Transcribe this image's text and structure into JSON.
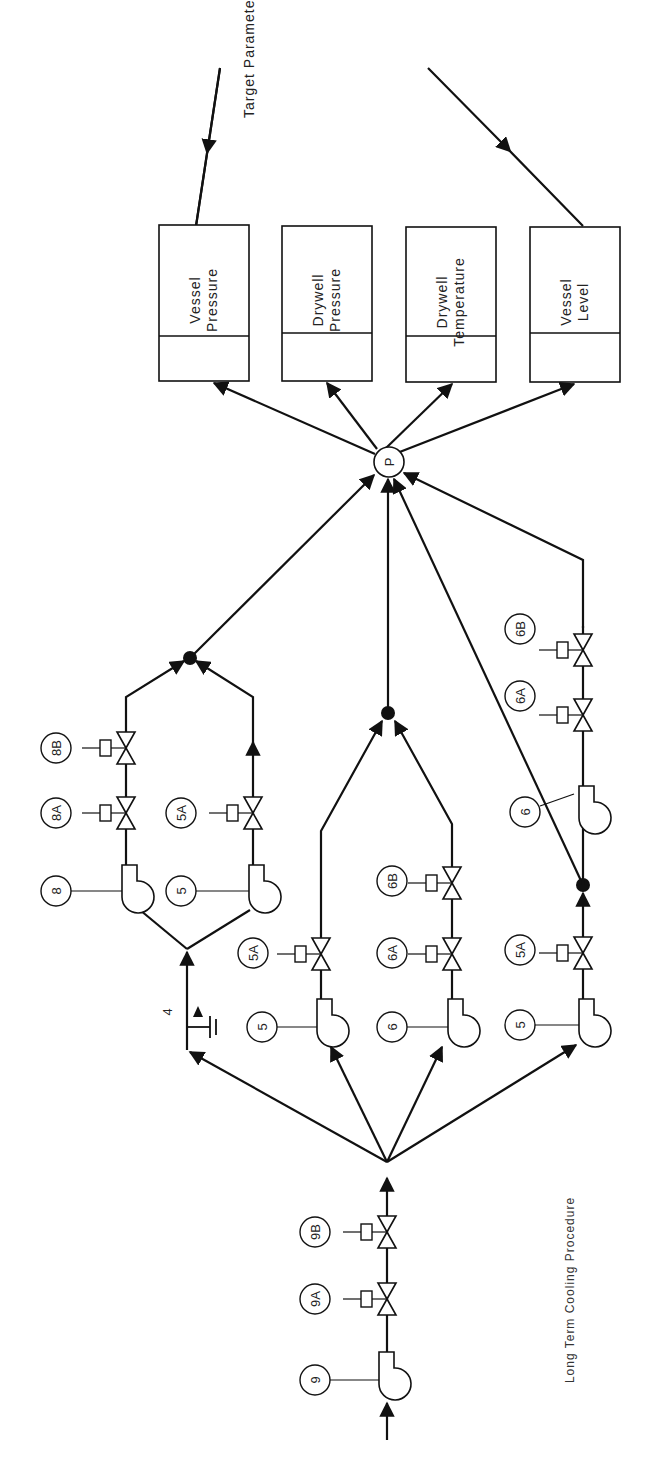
{
  "title": "Long Term Cooling Procedure",
  "target_label": "Target Parameter",
  "hub_label": "P",
  "check_valve_label": "4",
  "parameters": [
    {
      "line1": "Vessel",
      "line2": "Pressure"
    },
    {
      "line1": "Drywell",
      "line2": "Pressure"
    },
    {
      "line1": "Drywell",
      "line2": "Temperature"
    },
    {
      "line1": "Vessel",
      "line2": "Level"
    }
  ],
  "components": {
    "supply_pump": "9",
    "supply_valve_a": "9A",
    "supply_valve_b": "9B",
    "top_branch": {
      "pump_1": "8",
      "valve_1a": "8A",
      "valve_1b": "8B",
      "pump_2": "5",
      "valve_2a": "5A"
    },
    "middle_branch": {
      "pump_1": "5",
      "valve_1a": "5A",
      "pump_2": "6",
      "valve_2a": "6A",
      "valve_2b": "6B"
    },
    "bottom_branch": {
      "pump_1": "5",
      "valve_1a": "5A",
      "pump_2": "6",
      "valve_2a": "6A",
      "valve_2b": "6B"
    }
  }
}
